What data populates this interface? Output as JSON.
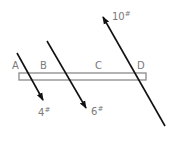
{
  "diagram": {
    "type": "beam-with-forces",
    "beam": {
      "x": 19,
      "y": 73,
      "width": 127,
      "height": 7,
      "stroke": "#8a8a8a"
    },
    "points": [
      {
        "label": "A",
        "x": 12,
        "y": 69
      },
      {
        "label": "B",
        "x": 40,
        "y": 69
      },
      {
        "label": "C",
        "x": 95,
        "y": 69
      },
      {
        "label": "D",
        "x": 137,
        "y": 69
      }
    ],
    "forces": [
      {
        "label": "4",
        "unit": "#",
        "x1": 17,
        "y1": 53,
        "x2": 43,
        "y2": 100,
        "label_x": 38,
        "label_y": 116
      },
      {
        "label": "6",
        "unit": "#",
        "x1": 47,
        "y1": 41,
        "x2": 86,
        "y2": 108,
        "label_x": 91,
        "label_y": 115
      },
      {
        "label": "10",
        "unit": "#",
        "x1": 165,
        "y1": 126,
        "x2": 103,
        "y2": 17,
        "label_x": 112,
        "label_y": 20
      }
    ],
    "colors": {
      "arrow": "#111111",
      "label": "#7a7a7a",
      "beam": "#8a8a8a"
    }
  }
}
